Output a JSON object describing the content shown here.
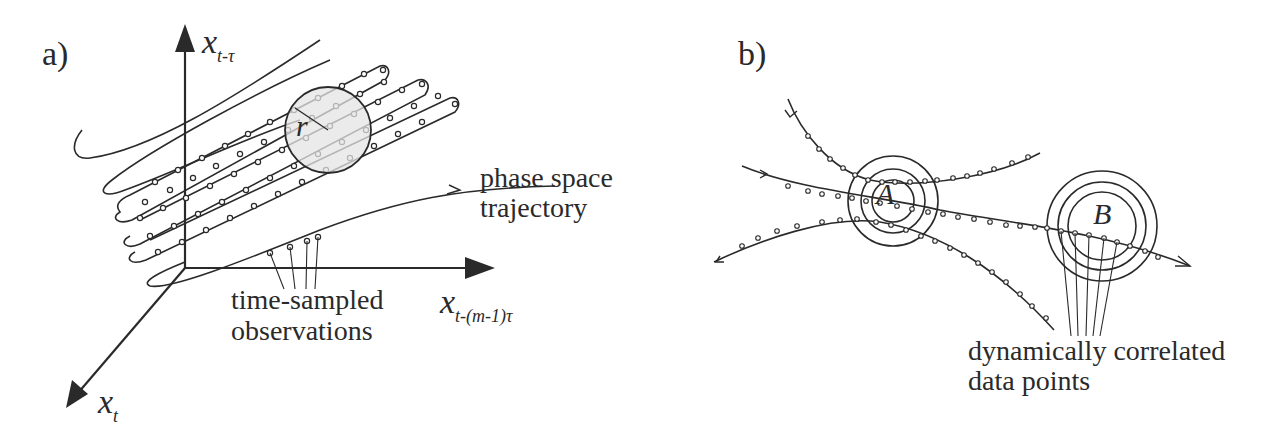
{
  "figure": {
    "panel_a": {
      "label": "a)",
      "axes": {
        "vertical": {
          "base": "x",
          "subscript": "t-τ"
        },
        "horizontal": {
          "base": "x",
          "subscript": "t-(m-1)τ"
        },
        "diagonal": {
          "base": "x",
          "subscript": "t"
        }
      },
      "neighborhood_radius_label": "r",
      "annotations": {
        "trajectory_line1": "phase space",
        "trajectory_line2": "trajectory",
        "samples_line1": "time-sampled",
        "samples_line2": "observations"
      }
    },
    "panel_b": {
      "label": "b)",
      "neighborhoods": [
        {
          "label": "A",
          "rings": 3
        },
        {
          "label": "B",
          "rings": 3
        }
      ],
      "annotations": {
        "correlated_line1": "dynamically correlated",
        "correlated_line2": "data points"
      }
    },
    "colors": {
      "ink": "#2a2a2a",
      "neighborhood_fill": "#e4e4e4",
      "background": "#ffffff"
    }
  }
}
